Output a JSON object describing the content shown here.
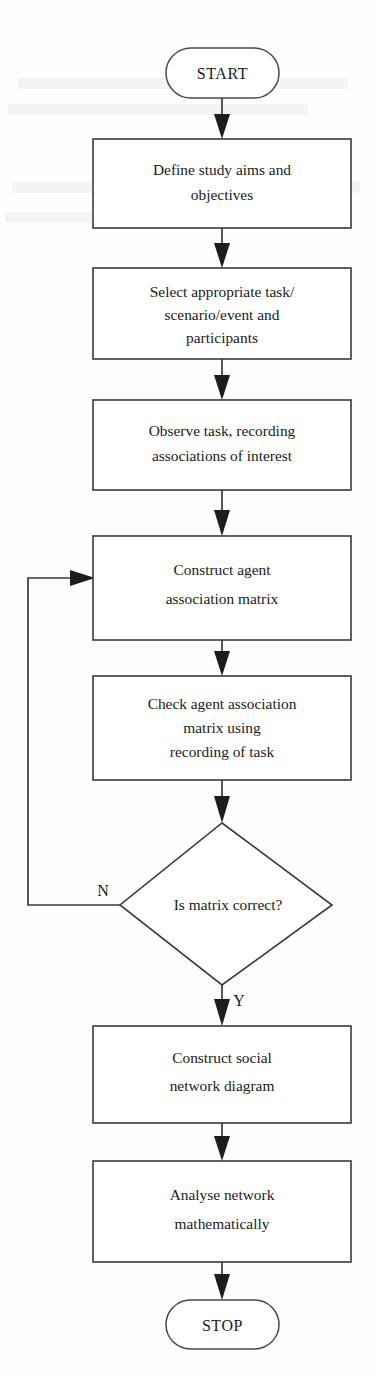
{
  "diagram": {
    "type": "flowchart",
    "orientation": "top-to-bottom",
    "title": "",
    "colors": {
      "stroke": "#3a3a3a",
      "text": "#1a1a1a",
      "background": "#fefefe",
      "arrow_fill": "#1d1d1d"
    },
    "nodes": [
      {
        "id": "start",
        "shape": "terminator",
        "label": "START"
      },
      {
        "id": "aims",
        "shape": "process",
        "lines": [
          "Define study aims and",
          "objectives"
        ]
      },
      {
        "id": "select",
        "shape": "process",
        "lines": [
          "Select appropriate task/",
          "scenario/event and",
          "participants"
        ]
      },
      {
        "id": "observe",
        "shape": "process",
        "lines": [
          "Observe task, recording",
          "associations of interest"
        ]
      },
      {
        "id": "construct_matrix",
        "shape": "process",
        "lines": [
          "Construct agent",
          "association matrix"
        ]
      },
      {
        "id": "check_matrix",
        "shape": "process",
        "lines": [
          "Check agent association",
          "matrix using",
          "recording of task"
        ]
      },
      {
        "id": "decision",
        "shape": "decision",
        "lines": [
          "Is matrix correct?"
        ]
      },
      {
        "id": "construct_network",
        "shape": "process",
        "lines": [
          "Construct social",
          "network diagram"
        ]
      },
      {
        "id": "analyse",
        "shape": "process",
        "lines": [
          "Analyse network",
          "mathematically"
        ]
      },
      {
        "id": "stop",
        "shape": "terminator",
        "label": "STOP"
      }
    ],
    "edges": [
      {
        "from": "start",
        "to": "aims",
        "label": ""
      },
      {
        "from": "aims",
        "to": "select",
        "label": ""
      },
      {
        "from": "select",
        "to": "observe",
        "label": ""
      },
      {
        "from": "observe",
        "to": "construct_matrix",
        "label": ""
      },
      {
        "from": "construct_matrix",
        "to": "check_matrix",
        "label": ""
      },
      {
        "from": "check_matrix",
        "to": "decision",
        "label": ""
      },
      {
        "from": "decision",
        "to": "construct_matrix",
        "label": "N"
      },
      {
        "from": "decision",
        "to": "construct_network",
        "label": "Y"
      },
      {
        "from": "construct_network",
        "to": "analyse",
        "label": ""
      },
      {
        "from": "analyse",
        "to": "stop",
        "label": ""
      }
    ],
    "edge_labels": {
      "no_branch": "N",
      "yes_branch": "Y"
    }
  }
}
